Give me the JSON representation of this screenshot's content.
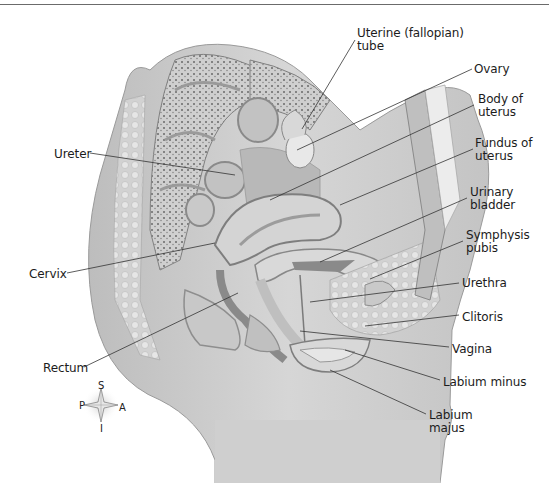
{
  "figure": {
    "labels": [
      {
        "id": "uterine-tube",
        "text": "Uterine (fallopian)\ntube",
        "x": 357,
        "y": 27
      },
      {
        "id": "ovary",
        "text": "Ovary",
        "x": 474,
        "y": 63
      },
      {
        "id": "body-of-uterus",
        "text": "Body of\nuterus",
        "x": 478,
        "y": 93
      },
      {
        "id": "fundus-of-uterus",
        "text": "Fundus of\nuterus",
        "x": 475,
        "y": 137
      },
      {
        "id": "ureter",
        "text": "Ureter",
        "x": 54,
        "y": 148
      },
      {
        "id": "urinary-bladder",
        "text": "Urinary\nbladder",
        "x": 470,
        "y": 186
      },
      {
        "id": "symphysis-pubis",
        "text": "Symphysis\npubis",
        "x": 466,
        "y": 229
      },
      {
        "id": "cervix",
        "text": "Cervix",
        "x": 29,
        "y": 268
      },
      {
        "id": "urethra",
        "text": "Urethra",
        "x": 462,
        "y": 277
      },
      {
        "id": "clitoris",
        "text": "Clitoris",
        "x": 462,
        "y": 311
      },
      {
        "id": "rectum",
        "text": "Rectum",
        "x": 43,
        "y": 362
      },
      {
        "id": "vagina",
        "text": "Vagina",
        "x": 452,
        "y": 343
      },
      {
        "id": "labium-minus",
        "text": "Labium minus",
        "x": 443,
        "y": 376
      },
      {
        "id": "labium-majus",
        "text": "Labium\nmajus",
        "x": 429,
        "y": 409
      }
    ],
    "compass": {
      "superior": "S",
      "inferior": "I",
      "posterior": "P",
      "anterior": "A"
    }
  }
}
